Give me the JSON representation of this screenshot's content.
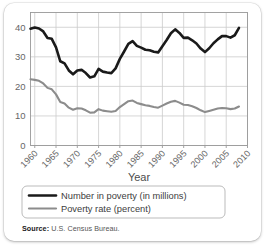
{
  "card": {
    "background": "#ffffff",
    "border_radius": 10
  },
  "source": {
    "label": "Source:",
    "text": "U.S. Census Bureau."
  },
  "legend": {
    "position": "below-axis",
    "border_color": "#b3b3b3",
    "items": [
      {
        "label": "Number in poverty (in millions)",
        "color": "#1a1a1a",
        "width": 2.6
      },
      {
        "label": "Poverty rate (percent)",
        "color": "#8c8c8c",
        "width": 2.2
      }
    ]
  },
  "chart_data": {
    "type": "line",
    "title": "",
    "xlabel": "Year",
    "ylabel": "",
    "xlim": [
      1959,
      2010
    ],
    "ylim": [
      0,
      45
    ],
    "xticks": [
      1960,
      1965,
      1970,
      1975,
      1980,
      1985,
      1990,
      1995,
      2000,
      2005,
      2010
    ],
    "xtick_labels": [
      "1960",
      "1965",
      "1970",
      "1975",
      "1980",
      "1985",
      "1990",
      "1995",
      "2000",
      "2005",
      "2010"
    ],
    "yticks": [
      0,
      10,
      20,
      30,
      40
    ],
    "ytick_labels": [
      "0",
      "10",
      "20",
      "30",
      "40"
    ],
    "grid": true,
    "grid_color": "#cccccc",
    "axis_color": "#999999",
    "tick_label_color": "#666666",
    "legend_position": "below",
    "x": [
      1959,
      1960,
      1961,
      1962,
      1963,
      1964,
      1965,
      1966,
      1967,
      1968,
      1969,
      1970,
      1971,
      1972,
      1973,
      1974,
      1975,
      1976,
      1977,
      1978,
      1979,
      1980,
      1981,
      1982,
      1983,
      1984,
      1985,
      1986,
      1987,
      1988,
      1989,
      1990,
      1991,
      1992,
      1993,
      1994,
      1995,
      1996,
      1997,
      1998,
      1999,
      2000,
      2001,
      2002,
      2003,
      2004,
      2005,
      2006,
      2007,
      2008
    ],
    "series": [
      {
        "name": "Number in poverty (in millions)",
        "color": "#1a1a1a",
        "values": [
          39.5,
          39.9,
          39.6,
          38.6,
          36.4,
          36.1,
          33.2,
          28.5,
          27.8,
          25.4,
          24.1,
          25.4,
          25.6,
          24.5,
          23.0,
          23.4,
          25.9,
          25.0,
          24.7,
          24.5,
          26.1,
          29.3,
          31.8,
          34.4,
          35.3,
          33.7,
          33.1,
          32.4,
          32.2,
          31.7,
          31.5,
          33.6,
          35.7,
          38.0,
          39.3,
          38.1,
          36.4,
          36.5,
          35.6,
          34.5,
          32.8,
          31.6,
          32.9,
          34.6,
          35.9,
          37.0,
          37.0,
          36.5,
          37.3,
          39.8
        ]
      },
      {
        "name": "Poverty rate (percent)",
        "color": "#8c8c8c",
        "values": [
          22.4,
          22.2,
          21.9,
          21.0,
          19.5,
          19.0,
          17.3,
          14.7,
          14.2,
          12.8,
          12.1,
          12.6,
          12.5,
          11.9,
          11.1,
          11.2,
          12.3,
          11.8,
          11.6,
          11.4,
          11.7,
          13.0,
          14.0,
          15.0,
          15.2,
          14.4,
          14.0,
          13.6,
          13.4,
          13.0,
          12.8,
          13.5,
          14.2,
          14.8,
          15.1,
          14.5,
          13.8,
          13.7,
          13.3,
          12.7,
          11.9,
          11.3,
          11.7,
          12.1,
          12.5,
          12.7,
          12.6,
          12.3,
          12.5,
          13.2
        ]
      }
    ]
  }
}
